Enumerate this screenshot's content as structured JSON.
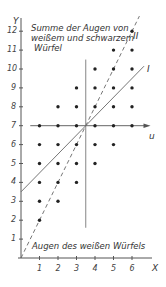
{
  "chart_data": {
    "type": "scatter",
    "title": "",
    "xlabel": "Augen des weißen Würfels",
    "ylabel": "Summe der Augen von weißem und schwarzem Würfel",
    "x_axis_name": "X",
    "y_axis_name": "Y",
    "u_axis_name": "u",
    "xlim": [
      0,
      7
    ],
    "ylim": [
      0,
      12.5
    ],
    "x_ticks": [
      1,
      2,
      3,
      4,
      5,
      6
    ],
    "y_ticks": [
      1,
      2,
      3,
      4,
      5,
      6,
      7,
      8,
      9,
      10,
      11,
      12
    ],
    "grid": false,
    "points": [
      [
        1,
        2
      ],
      [
        1,
        3
      ],
      [
        1,
        4
      ],
      [
        1,
        5
      ],
      [
        1,
        6
      ],
      [
        1,
        7
      ],
      [
        2,
        3
      ],
      [
        2,
        4
      ],
      [
        2,
        5
      ],
      [
        2,
        6
      ],
      [
        2,
        7
      ],
      [
        2,
        8
      ],
      [
        3,
        4
      ],
      [
        3,
        5
      ],
      [
        3,
        6
      ],
      [
        3,
        7
      ],
      [
        3,
        8
      ],
      [
        3,
        9
      ],
      [
        4,
        5
      ],
      [
        4,
        6
      ],
      [
        4,
        7
      ],
      [
        4,
        8
      ],
      [
        4,
        9
      ],
      [
        4,
        10
      ],
      [
        5,
        6
      ],
      [
        5,
        7
      ],
      [
        5,
        8
      ],
      [
        5,
        9
      ],
      [
        5,
        10
      ],
      [
        5,
        11
      ],
      [
        6,
        7
      ],
      [
        6,
        8
      ],
      [
        6,
        9
      ],
      [
        6,
        10
      ],
      [
        6,
        11
      ],
      [
        6,
        12
      ]
    ],
    "lines": [
      {
        "name": "I",
        "style": "solid",
        "slope": 1,
        "intercept": 3.5,
        "x_range": [
          0,
          6.65
        ]
      },
      {
        "name": "II",
        "style": "dashed",
        "slope": 2,
        "intercept": 0,
        "x_range": [
          0,
          6.4
        ]
      }
    ],
    "reference_lines": [
      {
        "name": "u",
        "orientation": "horizontal",
        "y": 7,
        "x_range": [
          0.5,
          7.0
        ],
        "arrow": true
      },
      {
        "name": "mean-x",
        "orientation": "vertical",
        "x": 3.5,
        "y_range": [
          1.6,
          10.5
        ]
      }
    ]
  },
  "labels": {
    "y_axis": "Y",
    "x_axis": "X",
    "u_axis": "u",
    "title_line1": "Summe der Augen von",
    "title_line2": "weißem und schwarzem",
    "title_line3": "Würfel",
    "x_caption": "Augen des weißen Würfels",
    "line_I": "I",
    "line_II": "II"
  }
}
